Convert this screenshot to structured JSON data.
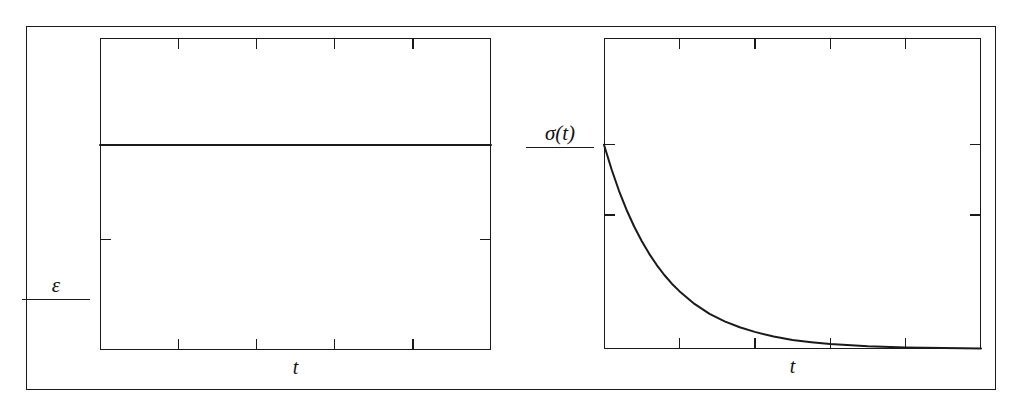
{
  "figure": {
    "background": "#ffffff",
    "ink_color": "#1a1a1a",
    "frame": {
      "x": 26,
      "y": 26,
      "width": 970,
      "height": 364
    }
  },
  "panels": [
    {
      "id": "strain",
      "name": "step-strain-panel",
      "ylabel": "ε",
      "xlabel": "t",
      "box": {
        "x": 100,
        "y": 38,
        "width": 391,
        "height": 312
      }
    },
    {
      "id": "stress",
      "name": "stress-relaxation-panel",
      "ylabel": "σ(t)",
      "xlabel": "t",
      "box": {
        "x": 604,
        "y": 38,
        "width": 377,
        "height": 311
      }
    }
  ],
  "chart_data": [
    {
      "type": "line",
      "id": "strain",
      "title": "",
      "xlabel": "t",
      "ylabel": "ε",
      "xlim": [
        0,
        1
      ],
      "ylim": [
        0,
        1
      ],
      "grid": false,
      "legend": null,
      "xticks": [
        0.2,
        0.4,
        0.6,
        0.8
      ],
      "xticklabels": [
        "",
        "",
        "",
        ""
      ],
      "yticks": [
        0.355
      ],
      "yticklabels": [
        ""
      ],
      "series": [
        {
          "name": "ε constant",
          "x": [
            0,
            0.05,
            0.1,
            0.2,
            0.3,
            0.4,
            0.5,
            0.6,
            0.7,
            0.8,
            0.9,
            1.0
          ],
          "y": [
            0.657,
            0.657,
            0.657,
            0.657,
            0.657,
            0.657,
            0.657,
            0.657,
            0.657,
            0.657,
            0.657,
            0.657
          ]
        }
      ],
      "description": "Constant step strain held at a fixed value for all t."
    },
    {
      "type": "line",
      "id": "stress",
      "title": "",
      "xlabel": "t",
      "ylabel": "σ(t)",
      "xlim": [
        0,
        1
      ],
      "ylim": [
        0,
        1
      ],
      "grid": false,
      "legend": null,
      "xticks": [
        0.2,
        0.4,
        0.6,
        0.8
      ],
      "xticklabels": [
        "",
        "",
        "",
        ""
      ],
      "yticks": [
        0.657,
        0.431
      ],
      "yticklabels": [
        "",
        ""
      ],
      "series": [
        {
          "name": "σ(t) exponential relaxation",
          "x": [
            0.0,
            0.02,
            0.04,
            0.06,
            0.08,
            0.1,
            0.12,
            0.14,
            0.16,
            0.18,
            0.2,
            0.24,
            0.28,
            0.32,
            0.36,
            0.4,
            0.45,
            0.5,
            0.55,
            0.6,
            0.7,
            0.8,
            0.9,
            1.0
          ],
          "y": [
            0.657,
            0.578,
            0.508,
            0.447,
            0.394,
            0.347,
            0.306,
            0.27,
            0.238,
            0.21,
            0.186,
            0.145,
            0.113,
            0.089,
            0.07,
            0.055,
            0.04,
            0.029,
            0.022,
            0.016,
            0.009,
            0.005,
            0.003,
            0.002
          ]
        }
      ],
      "description": "Stress decays exponentially from the initial step value toward zero."
    }
  ]
}
